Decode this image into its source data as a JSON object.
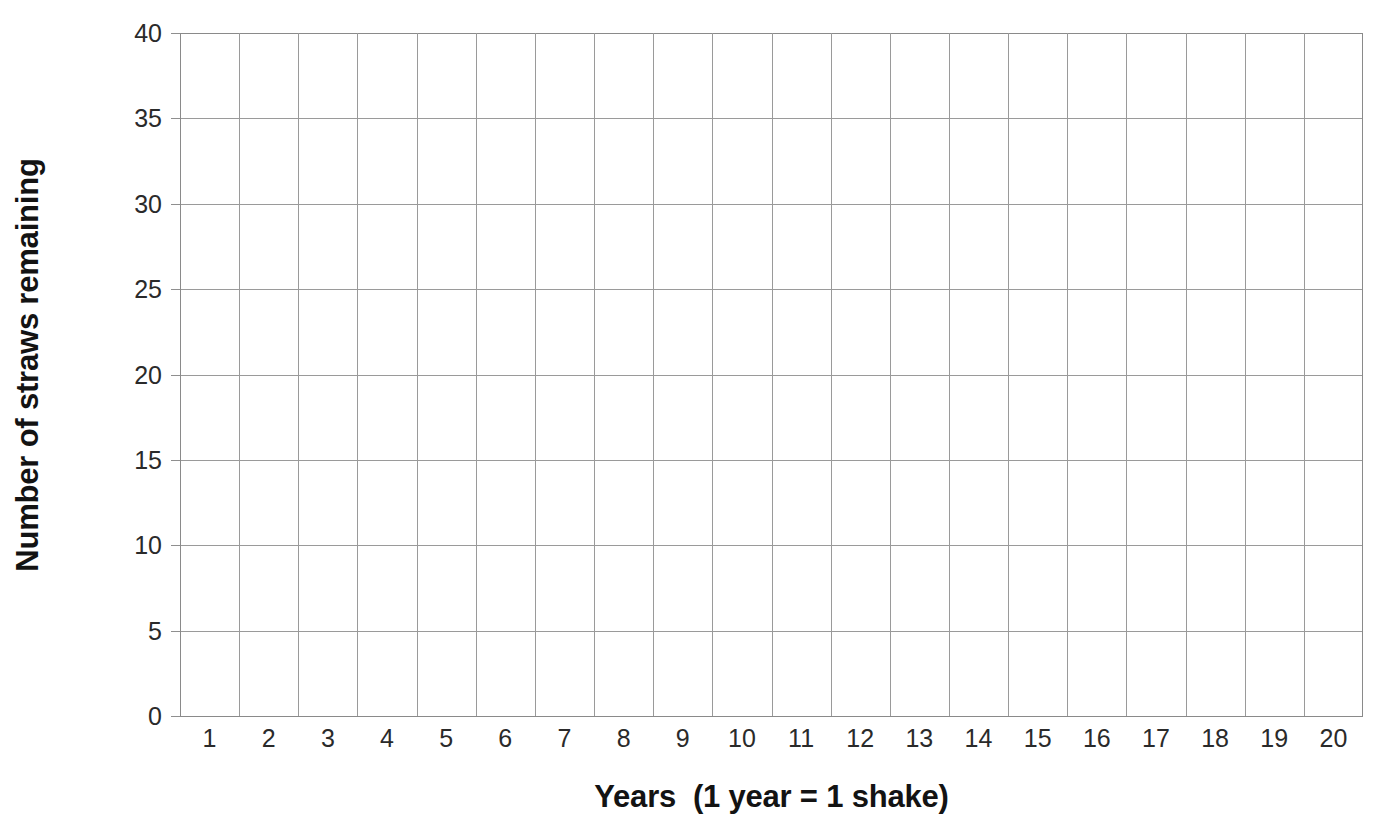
{
  "chart_data": {
    "type": "line",
    "title": "",
    "subtitle": "",
    "xlabel": "Years  (1 year = 1 shake)",
    "ylabel": "Number of straws remaining",
    "xlim": [
      0,
      20
    ],
    "ylim": [
      0,
      40
    ],
    "grid": true,
    "legend": null,
    "annotations": [],
    "x_tick_labels": [
      "1",
      "2",
      "3",
      "4",
      "5",
      "6",
      "7",
      "8",
      "9",
      "10",
      "11",
      "12",
      "13",
      "14",
      "15",
      "16",
      "17",
      "18",
      "19",
      "20"
    ],
    "x_tick_values": [
      1,
      2,
      3,
      4,
      5,
      6,
      7,
      8,
      9,
      10,
      11,
      12,
      13,
      14,
      15,
      16,
      17,
      18,
      19,
      20
    ],
    "x_major_gridline_values": [
      0,
      1,
      2,
      3,
      4,
      5,
      6,
      7,
      8,
      9,
      10,
      11,
      12,
      13,
      14,
      15,
      16,
      17,
      18,
      19,
      20
    ],
    "y_tick_labels": [
      "0",
      "5",
      "10",
      "15",
      "20",
      "25",
      "30",
      "35",
      "40"
    ],
    "y_tick_values": [
      0,
      5,
      10,
      15,
      20,
      25,
      30,
      35,
      40
    ],
    "y_major_gridline_values": [
      0,
      5,
      10,
      15,
      20,
      25,
      30,
      35,
      40
    ],
    "series": [],
    "values": [],
    "categories": [],
    "note": "blank grid, no data plotted"
  },
  "axes": {
    "y_title": "Number of straws remaining",
    "x_title": "Years  (1 year = 1 shake)"
  },
  "colors": {
    "background": "#ffffff",
    "gridline": "#9a9a9a",
    "axis": "#8a8a8a",
    "tick_text": "#2a2a2a",
    "title_text": "#131313"
  }
}
